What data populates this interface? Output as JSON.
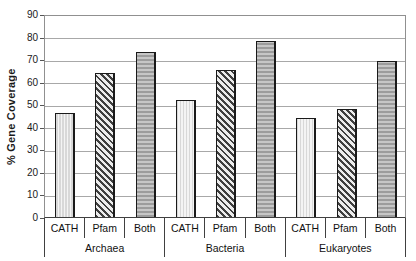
{
  "chart_data": {
    "type": "bar",
    "title": "",
    "ylabel": "% Gene Coverage",
    "xlabel": "",
    "ylim": [
      0,
      90
    ],
    "yticks": [
      0,
      10,
      20,
      30,
      40,
      50,
      60,
      70,
      80,
      90
    ],
    "grid": true,
    "legend_position": "none",
    "categories": [
      "CATH",
      "Pfam",
      "Both"
    ],
    "groups": [
      "Archaea",
      "Bacteria",
      "Eukaryotes"
    ],
    "series": [
      {
        "group": "Archaea",
        "values": [
          46,
          64,
          73
        ]
      },
      {
        "group": "Bacteria",
        "values": [
          52,
          65,
          78
        ]
      },
      {
        "group": "Eukaryotes",
        "values": [
          44,
          48,
          69
        ]
      }
    ],
    "bar_patterns": [
      {
        "category": "CATH",
        "pattern": "light-vertical-stripes",
        "fg": "#d8d8d8",
        "bg": "#f4f4f4"
      },
      {
        "category": "Pfam",
        "pattern": "dark-diagonal-hatch",
        "fg": "#3f3f3f",
        "bg": "#ececec"
      },
      {
        "category": "Both",
        "pattern": "gray-horizontal-stripes",
        "fg": "#9c9c9c",
        "bg": "#c6c6c6"
      }
    ],
    "colors": {
      "background": "#ffffff",
      "gridline": "#a8a8a8",
      "plot_border": "#909090",
      "axis_line": "#404040",
      "bar_border": "#1a1a1a",
      "text": "#1a1a1a"
    }
  }
}
